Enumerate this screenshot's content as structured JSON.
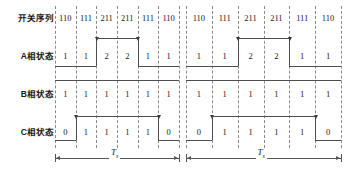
{
  "figure": {
    "type": "timing-diagram",
    "row_labels": [
      "开关序列",
      "A相状态",
      "B相状态",
      "C相状态"
    ],
    "period_label": "T",
    "period_subscript": "s",
    "periods": [
      {
        "index": 0,
        "switching_sequence": [
          "110",
          "111",
          "211",
          "211",
          "111",
          "110"
        ],
        "phase_a": [
          "1",
          "1",
          "2",
          "2",
          "1",
          "1"
        ],
        "phase_b": [
          "1",
          "1",
          "1",
          "1",
          "1",
          "1"
        ],
        "phase_c": [
          "0",
          "1",
          "1",
          "1",
          "1",
          "0"
        ]
      },
      {
        "index": 1,
        "switching_sequence": [
          "110",
          "111",
          "211",
          "211",
          "111",
          "110"
        ],
        "phase_a": [
          "1",
          "1",
          "2",
          "2",
          "1",
          "1"
        ],
        "phase_b": [
          "1",
          "1",
          "1",
          "1",
          "1",
          "1"
        ],
        "phase_c": [
          "0",
          "1",
          "1",
          "1",
          "1",
          "0"
        ]
      }
    ],
    "waveforms": {
      "phase_a": {
        "low_level": "1",
        "high_level": "2",
        "high_cells": [
          2,
          3
        ]
      },
      "phase_b": {
        "low_level": "1",
        "high_level": "1",
        "high_cells": []
      },
      "phase_c": {
        "low_level": "0",
        "high_level": "1",
        "high_cells": [
          1,
          2,
          3,
          4
        ]
      }
    },
    "colors": {
      "background": "#ffffff",
      "text": "#1a1a1a",
      "waveform": "#4d4d4d",
      "dashed_grid": "#8a8a8a",
      "dimension": "#555555"
    }
  }
}
